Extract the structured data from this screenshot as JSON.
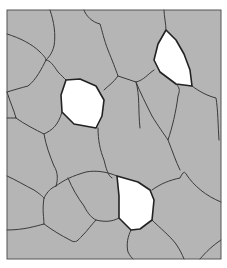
{
  "diagram": {
    "type": "microstructure-grain-boundaries",
    "frame": {
      "x": 7,
      "y": 10,
      "width": 214,
      "height": 249
    },
    "colors": {
      "background": "#ffffff",
      "matrix_fill": "#b5b5b5",
      "boundary": "#3a3a3a",
      "frame": "#555555",
      "highlight_grain_fill": "#ffffff"
    },
    "highlighted_grains": [
      {
        "id": "grain-top-right",
        "points": "166,30 158,44 154,60 160,72 176,84 192,86 190,70 184,54 176,40"
      },
      {
        "id": "grain-center-left",
        "points": "66,80 61,95 62,112 74,124 96,128 102,116 104,100 96,86 80,79"
      },
      {
        "id": "grain-bottom-center",
        "points": "117,176 119,196 119,218 131,230 140,229 152,220 154,200 150,190 138,182"
      }
    ],
    "boundaries": [
      "M50,10 C54,22 56,34 54,46 C52,54 48,58 46,60",
      "M7,34 C20,38 32,44 40,52 C44,56 46,58 46,60",
      "M46,60 C50,60 54,66 58,72 C62,76 64,78 66,80",
      "M46,60 C42,68 36,80 28,86 C20,88 14,90 7,92",
      "M7,92 C10,102 14,110 16,118",
      "M16,118 C12,118 8,118 7,118",
      "M16,118 C24,124 36,130 44,134 C52,130 58,126 62,112",
      "M44,134 C46,146 50,156 54,166 C58,172 58,180 56,186",
      "M84,10 C86,16 92,22 100,24 C102,30 104,40 108,50 C112,60 116,70 118,76 C114,82 108,86 104,90",
      "M118,76 C124,78 130,80 136,82 C144,80 148,74 154,70",
      "M164,10 C164,16 166,24 166,30",
      "M136,82 C140,92 146,104 152,116 C158,126 164,134 168,140 C172,128 176,112 178,96 C180,90 180,88 176,84",
      "M192,86 C200,92 208,96 216,98 C218,110 218,126 219,140",
      "M98,128 C98,140 100,150 104,160 C106,168 108,176 112,178",
      "M136,82 C140,96 138,110 140,128",
      "M7,176 C16,180 26,186 34,190 C40,194 42,196 44,198",
      "M56,186 C50,188 46,194 44,198",
      "M56,186 C64,180 72,176 86,172 C96,170 108,172 117,176",
      "M68,178 C72,188 78,198 84,206 C88,214 92,218 96,220 C104,222 112,222 119,218",
      "M44,198 C42,210 44,218 44,224 C36,226 24,230 7,230",
      "M44,224 C52,230 62,236 70,240 C76,244 78,240 82,236 C88,230 92,224 96,220",
      "M152,190 C160,184 170,180 180,178 C182,174 184,170 186,174 C194,186 206,196 221,202",
      "M168,140 C172,150 176,162 180,170",
      "M152,220 C160,228 170,236 176,244 C180,250 182,254 184,259",
      "M131,230 C128,236 126,244 128,252 C130,256 132,258 133,259",
      "M200,259 C206,252 212,246 221,240"
    ]
  }
}
